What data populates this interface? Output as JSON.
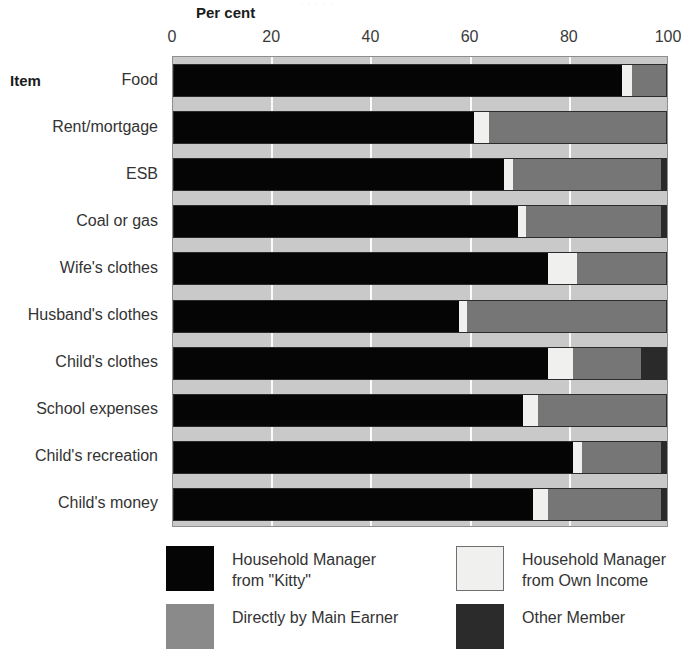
{
  "top_artifact": "· · · · ·",
  "axis": {
    "title": "Per cent",
    "item_label": "Item",
    "ticks": [
      "0",
      "20",
      "40",
      "60",
      "80",
      "100"
    ]
  },
  "legend": {
    "entries": [
      {
        "key": "kitty",
        "label": "Household Manager\nfrom \"Kitty\"",
        "color": "#050505"
      },
      {
        "key": "own",
        "label": "Household Manager\nfrom Own Income",
        "color": "#f0f0ee"
      },
      {
        "key": "main",
        "label": "Directly by Main Earner",
        "color": "#8a8a8a"
      },
      {
        "key": "other",
        "label": "Other Member",
        "color": "#2b2b2b"
      }
    ]
  },
  "chart_data": {
    "type": "bar",
    "orientation": "horizontal",
    "stacked": true,
    "title": "",
    "xlabel": "Per cent",
    "ylabel": "Item",
    "xlim": [
      0,
      100
    ],
    "grid": true,
    "legend_position": "bottom",
    "xticks": [
      0,
      20,
      40,
      60,
      80,
      100
    ],
    "categories": [
      "Food",
      "Rent/mortgage",
      "ESB",
      "Coal or gas",
      "Wife's clothes",
      "Husband's clothes",
      "Child's clothes",
      "School expenses",
      "Child's recreation",
      "Child's money"
    ],
    "series": [
      {
        "name": "Household Manager from \"Kitty\"",
        "color": "#050505",
        "values": [
          91,
          61,
          67,
          70,
          76,
          58,
          76,
          71,
          81,
          73
        ]
      },
      {
        "name": "Household Manager from Own Income",
        "color": "#f0f0ee",
        "values": [
          2,
          3,
          2,
          1.5,
          6,
          1.5,
          5,
          3,
          2,
          3
        ]
      },
      {
        "name": "Directly by Main Earner",
        "color": "#767676",
        "values": [
          7,
          36,
          30,
          27.5,
          18,
          40.5,
          14,
          26,
          16,
          23
        ]
      },
      {
        "name": "Other Member",
        "color": "#2a2a2a",
        "values": [
          0,
          0,
          1,
          1,
          0,
          0,
          5,
          0,
          1,
          1
        ]
      }
    ]
  }
}
